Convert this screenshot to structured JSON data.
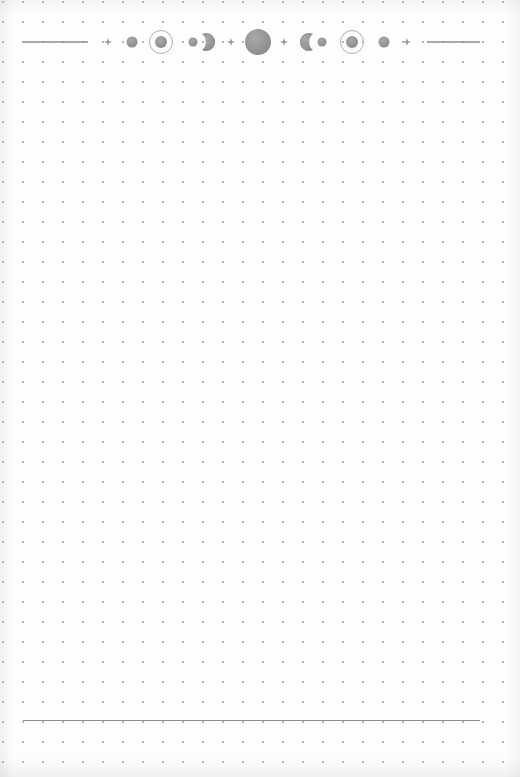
{
  "page": {
    "type": "dotted-journal-page",
    "background_color": "#fdfdfd",
    "dot_color": "#b9b9b9",
    "dot_spacing_px": 20
  },
  "header": {
    "decoration": "moon-phase-banner",
    "ink_color": "#8e8e8e",
    "elements": [
      {
        "name": "left-rule"
      },
      {
        "name": "sparkle-icon"
      },
      {
        "name": "new-moon-dot-icon"
      },
      {
        "name": "ringed-moon-icon"
      },
      {
        "name": "small-moon-dot-icon"
      },
      {
        "name": "waxing-crescent-icon"
      },
      {
        "name": "sparkle-icon"
      },
      {
        "name": "full-moon-icon"
      },
      {
        "name": "sparkle-icon"
      },
      {
        "name": "waning-crescent-icon"
      },
      {
        "name": "small-moon-dot-icon"
      },
      {
        "name": "ringed-moon-icon"
      },
      {
        "name": "new-moon-dot-icon"
      },
      {
        "name": "sparkle-icon"
      },
      {
        "name": "right-rule"
      }
    ]
  },
  "footer": {
    "decoration": "bottom-rule"
  }
}
